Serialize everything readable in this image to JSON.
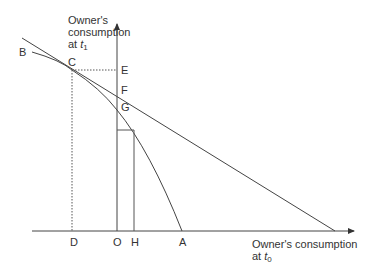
{
  "diagram": {
    "y_axis_label": {
      "line1": "Owner's",
      "line2": "consumption",
      "line3_prefix": "at ",
      "var": "t",
      "sub": "1"
    },
    "x_axis_label": {
      "line1": "Owner's consumption",
      "line2_prefix": "at ",
      "var": "t",
      "sub": "0"
    },
    "point_labels": {
      "B": "B",
      "C": "C",
      "E": "E",
      "F": "F",
      "G": "G",
      "D": "D",
      "O": "O",
      "H": "H",
      "A": "A"
    },
    "colors": {
      "line": "#333333",
      "text": "#333333",
      "background": "#ffffff"
    }
  }
}
